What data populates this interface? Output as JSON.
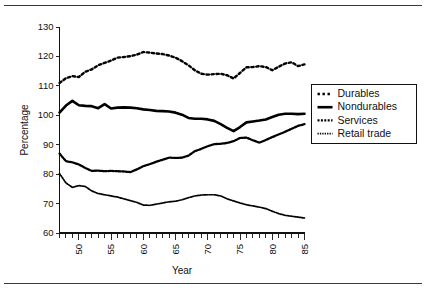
{
  "figure": {
    "rule_top": "horizontal-rule",
    "rule_bottom": "horizontal-rule"
  },
  "chart_data": {
    "type": "line",
    "title": "",
    "xlabel": "Year",
    "ylabel": "Percentage",
    "xlim": [
      1947,
      1985
    ],
    "ylim": [
      60,
      130
    ],
    "yticks": [
      60,
      70,
      80,
      90,
      100,
      110,
      120,
      130
    ],
    "ytick_labels": [
      "60",
      "70",
      "80",
      "90",
      "100",
      "110",
      "120",
      "130"
    ],
    "xticks": [
      1950,
      1955,
      1960,
      1965,
      1970,
      1975,
      1980,
      1985
    ],
    "xtick_labels": [
      "50",
      "55",
      "60",
      "65",
      "70",
      "75",
      "80",
      "85"
    ],
    "minor_xticks_every": 1,
    "grid": false,
    "legend_position": "right",
    "x": [
      1947,
      1948,
      1949,
      1950,
      1951,
      1952,
      1953,
      1954,
      1955,
      1956,
      1957,
      1958,
      1959,
      1960,
      1961,
      1962,
      1963,
      1964,
      1965,
      1966,
      1967,
      1968,
      1969,
      1970,
      1971,
      1972,
      1973,
      1974,
      1975,
      1976,
      1977,
      1978,
      1979,
      1980,
      1981,
      1982,
      1983,
      1984,
      1985
    ],
    "series": [
      {
        "name": "Durables",
        "style": "coarse-dotted",
        "values": [
          111.0,
          112.6,
          113.3,
          113.0,
          114.8,
          115.6,
          117.0,
          117.8,
          118.6,
          119.6,
          119.8,
          120.1,
          120.6,
          121.5,
          121.3,
          121.0,
          120.8,
          120.3,
          119.6,
          118.4,
          117.0,
          115.3,
          114.1,
          113.8,
          114.0,
          114.1,
          113.6,
          112.5,
          114.4,
          116.3,
          116.4,
          116.7,
          116.4,
          115.3,
          116.5,
          117.6,
          118.0,
          116.7,
          117.3
        ]
      },
      {
        "name": "Nondurables",
        "style": "solid",
        "values": [
          100.9,
          103.3,
          104.9,
          103.4,
          103.2,
          103.1,
          102.4,
          103.8,
          102.3,
          102.6,
          102.7,
          102.6,
          102.4,
          102.0,
          101.8,
          101.5,
          101.4,
          101.3,
          100.9,
          100.2,
          99.1,
          98.8,
          98.8,
          98.6,
          98.1,
          97.0,
          95.7,
          94.6,
          96.0,
          97.6,
          97.9,
          98.2,
          98.6,
          99.4,
          100.2,
          100.5,
          100.5,
          100.4,
          100.5
        ]
      },
      {
        "name": "Services",
        "style": "medium-dotted",
        "values": [
          87.0,
          84.4,
          84.0,
          83.3,
          82.1,
          81.1,
          81.2,
          81.0,
          81.1,
          81.0,
          80.9,
          80.7,
          81.6,
          82.7,
          83.4,
          84.2,
          84.9,
          85.6,
          85.5,
          85.6,
          86.3,
          87.8,
          88.6,
          89.5,
          90.2,
          90.3,
          90.6,
          91.2,
          92.3,
          92.4,
          91.5,
          90.7,
          91.6,
          92.6,
          93.5,
          94.4,
          95.4,
          96.4,
          97.0
        ]
      },
      {
        "name": "Retail trade",
        "style": "fine-dotted",
        "values": [
          80.2,
          77.0,
          75.5,
          76.1,
          75.8,
          74.3,
          73.4,
          73.0,
          72.6,
          72.2,
          71.6,
          71.0,
          70.4,
          69.5,
          69.4,
          69.8,
          70.2,
          70.6,
          70.8,
          71.3,
          72.0,
          72.6,
          72.9,
          73.0,
          73.0,
          72.6,
          71.6,
          70.9,
          70.2,
          69.6,
          69.2,
          68.8,
          68.3,
          67.4,
          66.6,
          66.0,
          65.7,
          65.4,
          65.1
        ]
      }
    ]
  },
  "legend": {
    "items": [
      {
        "label": "Durables",
        "swatch": "coarse-dotted"
      },
      {
        "label": "Nondurables",
        "swatch": "solid"
      },
      {
        "label": "Services",
        "swatch": "medium-dotted"
      },
      {
        "label": "Retail trade",
        "swatch": "fine-dotted"
      }
    ]
  }
}
